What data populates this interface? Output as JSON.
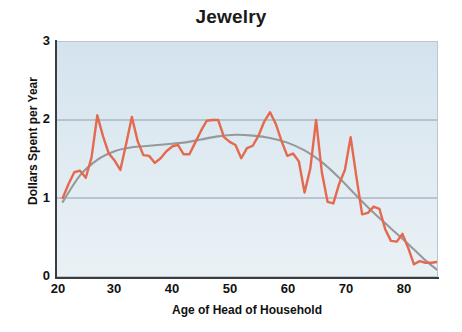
{
  "chart_data": {
    "type": "line",
    "title": "Jewelry",
    "xlabel": "Age of Head of Household",
    "ylabel": "Dollars Spent per Year",
    "xlim": [
      20,
      86
    ],
    "ylim": [
      0,
      3
    ],
    "xticks": [
      20,
      30,
      40,
      50,
      60,
      70,
      80
    ],
    "yticks": [
      0,
      1,
      2,
      3
    ],
    "grid": "horizontal-gridlines-at-1-and-2",
    "legend": "none",
    "plot_background": "#dce9f1",
    "series": [
      {
        "name": "Observed spending",
        "color": "#e4694e",
        "style": "jagged-line",
        "x": [
          21,
          22,
          23,
          24,
          25,
          26,
          27,
          28,
          29,
          30,
          31,
          32,
          33,
          34,
          35,
          36,
          37,
          38,
          39,
          40,
          41,
          42,
          43,
          44,
          45,
          46,
          47,
          48,
          49,
          50,
          51,
          52,
          53,
          54,
          55,
          56,
          57,
          58,
          59,
          60,
          61,
          62,
          63,
          64,
          65,
          66,
          67,
          68,
          69,
          70,
          71,
          72,
          73,
          74,
          75,
          76,
          77,
          78,
          79,
          80,
          81,
          82,
          83,
          84,
          85,
          86
        ],
        "values": [
          1.0,
          1.18,
          1.33,
          1.35,
          1.26,
          1.52,
          2.06,
          1.79,
          1.57,
          1.48,
          1.36,
          1.69,
          2.04,
          1.73,
          1.55,
          1.54,
          1.45,
          1.51,
          1.6,
          1.66,
          1.68,
          1.56,
          1.56,
          1.71,
          1.86,
          1.99,
          2.0,
          2.0,
          1.78,
          1.72,
          1.68,
          1.51,
          1.64,
          1.67,
          1.8,
          1.98,
          2.1,
          1.95,
          1.73,
          1.54,
          1.57,
          1.47,
          1.07,
          1.38,
          2.0,
          1.33,
          0.95,
          0.93,
          1.18,
          1.36,
          1.78,
          1.27,
          0.79,
          0.81,
          0.89,
          0.86,
          0.6,
          0.45,
          0.44,
          0.54,
          0.36,
          0.15,
          0.19,
          0.17,
          0.17,
          0.18
        ]
      },
      {
        "name": "Fitted trend",
        "color": "#96999a",
        "style": "smooth-curve",
        "x": [
          21,
          24,
          27,
          30,
          33,
          36,
          39,
          42,
          45,
          48,
          51,
          54,
          57,
          60,
          63,
          66,
          69,
          72,
          75,
          78,
          81,
          84,
          86
        ],
        "values": [
          0.95,
          1.29,
          1.49,
          1.6,
          1.65,
          1.67,
          1.69,
          1.71,
          1.75,
          1.79,
          1.81,
          1.8,
          1.77,
          1.71,
          1.61,
          1.46,
          1.26,
          1.03,
          0.81,
          0.61,
          0.41,
          0.2,
          0.08
        ]
      }
    ]
  },
  "axes": {
    "y_tick_labels": [
      "3",
      "2",
      "1",
      "0"
    ],
    "x_tick_labels": [
      "20",
      "30",
      "40",
      "50",
      "60",
      "70",
      "80"
    ]
  }
}
